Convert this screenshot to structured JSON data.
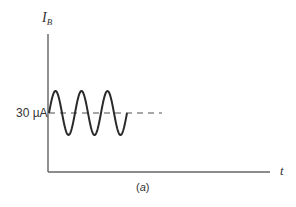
{
  "chart_data": {
    "type": "line",
    "title": "",
    "caption": "(a)",
    "ylabel": "I",
    "ylabel_subscript": "B",
    "xlabel": "t",
    "y_tick_labels": [
      "30 µA"
    ],
    "reference_line": {
      "label": "30 µA",
      "style": "dashed",
      "value": 30
    },
    "series": [
      {
        "name": "I_B",
        "description": "sinusoidal base current oscillating about 30 µA DC level",
        "dc_offset": 30,
        "cycles": 3,
        "shape": "sine"
      }
    ],
    "grid": false,
    "legend": null
  },
  "labels": {
    "ylabel_main": "I",
    "ylabel_sub": "B",
    "ytick": "30 µA",
    "xlabel": "t",
    "caption_open": "(",
    "caption_letter": "a",
    "caption_close": ")"
  },
  "colors": {
    "axis": "#555555",
    "wave": "#2a2a2a",
    "dashed": "#8a8a8a",
    "text": "#333333"
  }
}
